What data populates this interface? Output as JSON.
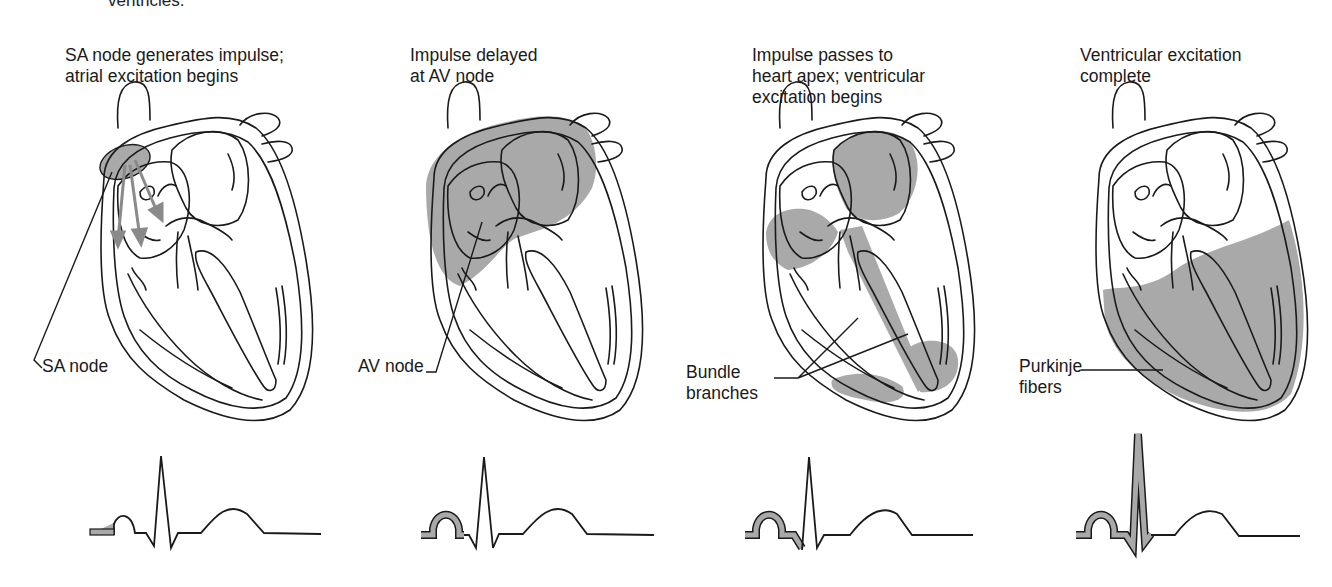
{
  "top_fragment": "ventricles.",
  "colors": {
    "shade": "#a9a9a9",
    "line": "#1a1a1a",
    "arrow": "#8a8a8a",
    "background": "#ffffff"
  },
  "panels": [
    {
      "caption": "SA node generates impulse;\natrial excitation begins",
      "label": "SA node",
      "ecg_highlight": "P wave start"
    },
    {
      "caption": "Impulse delayed\nat AV node",
      "label": "AV node",
      "ecg_highlight": "P wave"
    },
    {
      "caption": "Impulse passes to\nheart apex; ventricular\nexcitation begins",
      "label": "Bundle\nbranches",
      "ecg_highlight": "P wave + Q"
    },
    {
      "caption": "Ventricular excitation\ncomplete",
      "label": "Purkinje\nfibers",
      "ecg_highlight": "P wave + QRS"
    }
  ]
}
